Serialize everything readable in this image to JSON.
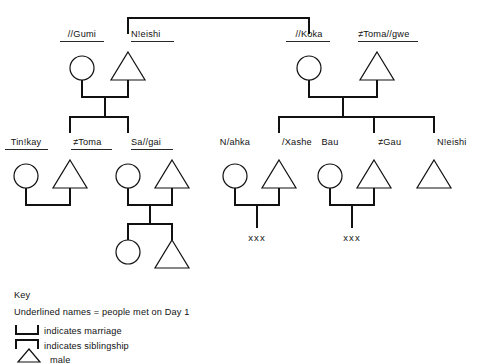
{
  "diagram": {
    "generation1": [
      {
        "id": "g1-gumi",
        "name": "//Gumi",
        "sex": "female",
        "underlined": true,
        "x": 82,
        "y": 68
      },
      {
        "id": "g1-neishi",
        "name": "N!eishi",
        "sex": "male",
        "underlined": true,
        "x": 128,
        "y": 68
      },
      {
        "id": "g1-koka",
        "name": "//Koka",
        "sex": "female",
        "underlined": true,
        "x": 309,
        "y": 68
      },
      {
        "id": "g1-tomagwe",
        "name": "≠Toma//gwe",
        "sex": "male",
        "underlined": true,
        "x": 355,
        "y": 68
      }
    ],
    "generation2": [
      {
        "id": "g2-tinkay",
        "name": "Tin!kay",
        "sex": "female",
        "underlined": true,
        "x": 26,
        "y": 176
      },
      {
        "id": "g2-toma",
        "name": "≠Toma",
        "sex": "male",
        "underlined": true,
        "x": 70,
        "y": 176
      },
      {
        "id": "g2-sagai",
        "name": "Sa//gai",
        "sex": "female",
        "underlined": true,
        "x": 128,
        "y": 176
      },
      {
        "id": "g2-sagai-husband",
        "name": "",
        "sex": "male",
        "underlined": false,
        "x": 172,
        "y": 176
      },
      {
        "id": "g2-nahka",
        "name": "N/ahka",
        "sex": "female",
        "underlined": false,
        "x": 235,
        "y": 176
      },
      {
        "id": "g2-xashe",
        "name": "/Xashe",
        "sex": "male",
        "underlined": false,
        "x": 279,
        "y": 176
      },
      {
        "id": "g2-bau",
        "name": "Bau",
        "sex": "female",
        "underlined": false,
        "x": 330,
        "y": 176
      },
      {
        "id": "g2-gau",
        "name": "≠Gau",
        "sex": "male",
        "underlined": false,
        "x": 374,
        "y": 176
      },
      {
        "id": "g2-neishi2",
        "name": "N!eishi",
        "sex": "male",
        "underlined": false,
        "x": 434,
        "y": 176
      }
    ],
    "generation3": [
      {
        "id": "g3-daughter",
        "name": "",
        "sex": "female",
        "underlined": false,
        "x": 128,
        "y": 245
      },
      {
        "id": "g3-son",
        "name": "",
        "sex": "male",
        "underlined": false,
        "x": 172,
        "y": 245
      }
    ],
    "unknown_children": [
      {
        "id": "xxx-xashe",
        "label": "xxx",
        "x": 257,
        "y": 238
      },
      {
        "id": "xxx-gau",
        "label": "xxx",
        "x": 352,
        "y": 238
      }
    ]
  },
  "key": {
    "heading": "Key",
    "note": "Underlined names = people met on Day 1",
    "entries": [
      {
        "id": "key-marriage",
        "symbol": "marriage-bracket",
        "label": "indicates marriage"
      },
      {
        "id": "key-siblingship",
        "symbol": "siblingship-bracket",
        "label": "indicates siblingship"
      },
      {
        "id": "key-male",
        "symbol": "male-triangle",
        "label": "male"
      }
    ]
  },
  "colors": {
    "ink": "#111111",
    "background": "#ffffff"
  }
}
